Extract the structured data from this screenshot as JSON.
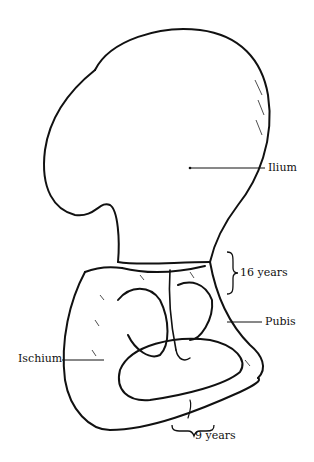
{
  "figure": {
    "labels": {
      "ilium": "Ilium",
      "age_upper": "16 years",
      "pubis": "Pubis",
      "ischium": "Ischium",
      "age_lower": "9 years"
    },
    "colors": {
      "ink": "#111111",
      "background": "#ffffff"
    }
  }
}
